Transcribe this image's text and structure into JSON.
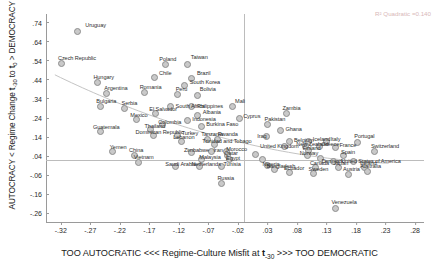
{
  "chart_data": {
    "type": "scatter",
    "title": "",
    "xlabel": "TOO AUTOCRATIC <<< Regime-Culture Misfit at t-30 >>> TOO DEMOCRATIC",
    "ylabel": "AUTOCRACY < Regime Change t-30 to t0 > DEMOCRACY",
    "xlim": [
      -0.345,
      0.295
    ],
    "ylim": [
      -0.305,
      0.785
    ],
    "xticks": [
      "-.32",
      "-.27",
      "-.22",
      "-.17",
      "-.12",
      "-.07",
      "-.02",
      ".03",
      ".08",
      ".13",
      ".18",
      ".23",
      ".28"
    ],
    "xtick_values": [
      -0.32,
      -0.27,
      -0.22,
      -0.17,
      -0.12,
      -0.07,
      -0.02,
      0.03,
      0.08,
      0.13,
      0.18,
      0.23,
      0.28
    ],
    "yticks": [
      ".74",
      ".64",
      ".54",
      ".44",
      ".34",
      ".24",
      ".14",
      ".04",
      "-.06",
      "-.16",
      "-.26"
    ],
    "ytick_values": [
      0.74,
      0.64,
      0.54,
      0.44,
      0.34,
      0.24,
      0.14,
      0.04,
      -0.06,
      -0.16,
      -0.26
    ],
    "grid": false,
    "legend": "none",
    "annotation": "R² Quadratic =0.140",
    "reference_lines": {
      "vertical_x": -0.01,
      "horizontal_y": 0.02
    },
    "fit": "quadratic",
    "points": [
      {
        "label": "Uruguay",
        "x": -0.292,
        "y": 0.695
      },
      {
        "label": "Czech Republic",
        "x": -0.318,
        "y": 0.525
      },
      {
        "label": "Poland",
        "x": -0.143,
        "y": 0.518
      },
      {
        "label": "Taiwan",
        "x": -0.105,
        "y": 0.52
      },
      {
        "label": "Hungary",
        "x": -0.258,
        "y": 0.425
      },
      {
        "label": "Chile",
        "x": -0.162,
        "y": 0.452
      },
      {
        "label": "Brazil",
        "x": -0.098,
        "y": 0.447
      },
      {
        "label": "South Korea",
        "x": -0.11,
        "y": 0.41
      },
      {
        "label": "Argentina",
        "x": -0.243,
        "y": 0.368
      },
      {
        "label": "Romania",
        "x": -0.178,
        "y": 0.372
      },
      {
        "label": "Peru",
        "x": -0.122,
        "y": 0.362
      },
      {
        "label": "Bolivia",
        "x": -0.088,
        "y": 0.358
      },
      {
        "label": "Bulgaria",
        "x": -0.253,
        "y": 0.3
      },
      {
        "label": "Serbia",
        "x": -0.212,
        "y": 0.288
      },
      {
        "label": "South Africa",
        "x": -0.134,
        "y": 0.3
      },
      {
        "label": "Philippines",
        "x": -0.098,
        "y": 0.3
      },
      {
        "label": "Mali",
        "x": -0.03,
        "y": 0.3
      },
      {
        "label": "El Salvador",
        "x": -0.16,
        "y": 0.262
      },
      {
        "label": "Albania",
        "x": -0.088,
        "y": 0.255
      },
      {
        "label": "Cyprus",
        "x": -0.018,
        "y": 0.238
      },
      {
        "label": "Mexico",
        "x": -0.192,
        "y": 0.232
      },
      {
        "label": "Indonesia",
        "x": -0.106,
        "y": 0.225
      },
      {
        "label": "Zambia",
        "x": 0.062,
        "y": 0.262
      },
      {
        "label": "Colombia",
        "x": -0.148,
        "y": 0.205
      },
      {
        "label": "Burkina Faso",
        "x": -0.082,
        "y": 0.198
      },
      {
        "label": "Pakistan",
        "x": 0.03,
        "y": 0.205
      },
      {
        "label": "Thailand",
        "x": -0.168,
        "y": 0.178
      },
      {
        "label": "Guatemala",
        "x": -0.252,
        "y": 0.168
      },
      {
        "label": "Ghana",
        "x": 0.052,
        "y": 0.172
      },
      {
        "label": "Dominican Republic",
        "x": -0.163,
        "y": 0.148
      },
      {
        "label": "Turkey",
        "x": -0.122,
        "y": 0.15
      },
      {
        "label": "Iraq",
        "x": 0.028,
        "y": 0.142
      },
      {
        "label": "Lebanon",
        "x": -0.116,
        "y": 0.118
      },
      {
        "label": "Tanzania",
        "x": -0.072,
        "y": 0.128
      },
      {
        "label": "Rwanda",
        "x": -0.054,
        "y": 0.128
      },
      {
        "label": "Belgium",
        "x": 0.068,
        "y": 0.118
      },
      {
        "label": "Iceland",
        "x": 0.1,
        "y": 0.118
      },
      {
        "label": "Italy",
        "x": 0.13,
        "y": 0.118
      },
      {
        "label": "Portugal",
        "x": 0.182,
        "y": 0.112
      },
      {
        "label": "Trinidad and Tobago",
        "x": -0.06,
        "y": 0.102
      },
      {
        "label": "Yemen",
        "x": -0.232,
        "y": 0.062
      },
      {
        "label": "United Kingdom",
        "x": 0.058,
        "y": 0.09
      },
      {
        "label": "New Zealand",
        "x": 0.094,
        "y": 0.09
      },
      {
        "label": "Greece",
        "x": 0.118,
        "y": 0.09
      },
      {
        "label": "France",
        "x": 0.145,
        "y": 0.088
      },
      {
        "label": "China",
        "x": -0.196,
        "y": 0.045
      },
      {
        "label": "Zimbabwe",
        "x": -0.098,
        "y": 0.06
      },
      {
        "label": "Iran",
        "x": -0.065,
        "y": 0.062
      },
      {
        "label": "Morocco",
        "x": -0.04,
        "y": 0.062
      },
      {
        "label": "Finland",
        "x": 0.1,
        "y": 0.068
      },
      {
        "label": "Switzerland",
        "x": 0.212,
        "y": 0.065
      },
      {
        "label": "Norway",
        "x": 0.098,
        "y": 0.045
      },
      {
        "label": "Qatar",
        "x": -0.038,
        "y": 0.042
      },
      {
        "label": "Qatar2",
        "x": 0.01,
        "y": 0.048
      },
      {
        "label": "Spain",
        "x": 0.158,
        "y": 0.045
      },
      {
        "label": "Vietnam",
        "x": -0.188,
        "y": 0.008
      },
      {
        "label": "Malaysia",
        "x": -0.082,
        "y": 0.022
      },
      {
        "label": "Egypt",
        "x": -0.035,
        "y": 0.022
      },
      {
        "label": "Brazil2",
        "x": 0.022,
        "y": 0.022
      },
      {
        "label": "Polaris",
        "x": 0.12,
        "y": 0.028
      },
      {
        "label": "Denmark",
        "x": 0.142,
        "y": 0.012
      },
      {
        "label": "United States of America",
        "x": 0.175,
        "y": 0.012
      },
      {
        "label": "Saudi Arabia",
        "x": -0.126,
        "y": -0.012
      },
      {
        "label": "Netherlands",
        "x": -0.085,
        "y": -0.012
      },
      {
        "label": "Tunisia",
        "x": -0.048,
        "y": -0.012
      },
      {
        "label": "Nigeria",
        "x": 0.03,
        "y": -0.008
      },
      {
        "label": "Canada",
        "x": 0.112,
        "y": -0.018
      },
      {
        "label": "Japan",
        "x": 0.15,
        "y": -0.022
      },
      {
        "label": "Ireland",
        "x": 0.195,
        "y": -0.018
      },
      {
        "label": "Bangladesh",
        "x": 0.042,
        "y": -0.032
      },
      {
        "label": "Australia",
        "x": 0.2,
        "y": -0.038
      },
      {
        "label": "Ecuador",
        "x": 0.068,
        "y": -0.048
      },
      {
        "label": "Sweden",
        "x": 0.108,
        "y": -0.052
      },
      {
        "label": "Austria",
        "x": 0.168,
        "y": -0.058
      },
      {
        "label": "Russia",
        "x": -0.048,
        "y": -0.105
      },
      {
        "label": "Venezuela",
        "x": 0.145,
        "y": -0.232
      }
    ],
    "labelled_points": [
      {
        "label": "Uruguay",
        "x": -0.292,
        "y": 0.695,
        "dx": 8,
        "dy": -9
      },
      {
        "label": "Czech Republic",
        "x": -0.318,
        "y": 0.525,
        "dx": -4,
        "dy": -9
      },
      {
        "label": "Poland",
        "x": -0.143,
        "y": 0.518,
        "dx": -6,
        "dy": -9
      },
      {
        "label": "Taiwan",
        "x": -0.105,
        "y": 0.52,
        "dx": 3,
        "dy": -11
      },
      {
        "label": "Hungary",
        "x": -0.258,
        "y": 0.425,
        "dx": -4,
        "dy": -9
      },
      {
        "label": "Chile",
        "x": -0.162,
        "y": 0.452,
        "dx": 5,
        "dy": -8
      },
      {
        "label": "Brazil",
        "x": -0.098,
        "y": 0.447,
        "dx": 5,
        "dy": -8
      },
      {
        "label": "South Korea",
        "x": -0.11,
        "y": 0.41,
        "dx": 5,
        "dy": -7
      },
      {
        "label": "Argentina",
        "x": -0.243,
        "y": 0.368,
        "dx": -2,
        "dy": -9
      },
      {
        "label": "Romania",
        "x": -0.178,
        "y": 0.372,
        "dx": -5,
        "dy": -9
      },
      {
        "label": "Peru",
        "x": -0.122,
        "y": 0.362,
        "dx": -2,
        "dy": -9
      },
      {
        "label": "Bolivia",
        "x": -0.088,
        "y": 0.358,
        "dx": 2,
        "dy": -9
      },
      {
        "label": "Bulgaria",
        "x": -0.253,
        "y": 0.3,
        "dx": -4,
        "dy": -9
      },
      {
        "label": "Serbia",
        "x": -0.212,
        "y": 0.288,
        "dx": -3,
        "dy": -9
      },
      {
        "label": "South Africa",
        "x": -0.134,
        "y": 0.3,
        "dx": 5,
        "dy": -4
      },
      {
        "label": "Philippines",
        "x": -0.098,
        "y": 0.3,
        "dx": 5,
        "dy": -4
      },
      {
        "label": "Mali",
        "x": -0.03,
        "y": 0.3,
        "dx": 3,
        "dy": -9
      },
      {
        "label": "El Salvador",
        "x": -0.16,
        "y": 0.262,
        "dx": -6,
        "dy": -8
      },
      {
        "label": "Albania",
        "x": -0.088,
        "y": 0.255,
        "dx": 5,
        "dy": -6
      },
      {
        "label": "Cyprus",
        "x": -0.018,
        "y": 0.238,
        "dx": 4,
        "dy": -5
      },
      {
        "label": "Mexico",
        "x": -0.192,
        "y": 0.232,
        "dx": -6,
        "dy": -8
      },
      {
        "label": "Indonesia",
        "x": -0.106,
        "y": 0.225,
        "dx": 5,
        "dy": -5
      },
      {
        "label": "Zambia",
        "x": 0.062,
        "y": 0.262,
        "dx": -4,
        "dy": -9
      },
      {
        "label": "Colombia",
        "x": -0.148,
        "y": 0.205,
        "dx": -4,
        "dy": -6
      },
      {
        "label": "Burkina Faso",
        "x": -0.082,
        "y": 0.198,
        "dx": 5,
        "dy": -5
      },
      {
        "label": "Pakistan",
        "x": 0.03,
        "y": 0.205,
        "dx": -3,
        "dy": -9
      },
      {
        "label": "Thailand",
        "x": -0.168,
        "y": 0.178,
        "dx": -6,
        "dy": -7
      },
      {
        "label": "Guatemala",
        "x": -0.252,
        "y": 0.168,
        "dx": -8,
        "dy": -8
      },
      {
        "label": "Ghana",
        "x": 0.052,
        "y": 0.172,
        "dx": 5,
        "dy": -5
      },
      {
        "label": "Dominican Republic",
        "x": -0.163,
        "y": 0.148,
        "dx": -18,
        "dy": -7
      },
      {
        "label": "Turkey",
        "x": -0.122,
        "y": 0.15,
        "dx": 4,
        "dy": -5
      },
      {
        "label": "Iraq",
        "x": 0.028,
        "y": 0.142,
        "dx": -9,
        "dy": -4
      },
      {
        "label": "Lebanon",
        "x": -0.116,
        "y": 0.118,
        "dx": -8,
        "dy": -7
      },
      {
        "label": "Tanzania",
        "x": -0.072,
        "y": 0.128,
        "dx": -6,
        "dy": -8
      },
      {
        "label": "Rwanda",
        "x": -0.054,
        "y": 0.128,
        "dx": 0,
        "dy": -8
      },
      {
        "label": "Belgium",
        "x": 0.068,
        "y": 0.118,
        "dx": 4,
        "dy": -4
      },
      {
        "label": "Iceland",
        "x": 0.1,
        "y": 0.118,
        "dx": 4,
        "dy": -5
      },
      {
        "label": "Italy",
        "x": 0.13,
        "y": 0.118,
        "dx": 4,
        "dy": -5
      },
      {
        "label": "Portugal",
        "x": 0.182,
        "y": 0.112,
        "dx": -3,
        "dy": -9
      },
      {
        "label": "Trinidad and Tobago",
        "x": -0.06,
        "y": 0.102,
        "dx": -12,
        "dy": -6
      },
      {
        "label": "Yemen",
        "x": -0.232,
        "y": 0.062,
        "dx": -3,
        "dy": -8
      },
      {
        "label": "United Kingdom",
        "x": 0.058,
        "y": 0.09,
        "dx": -24,
        "dy": -4
      },
      {
        "label": "New Zealand",
        "x": 0.094,
        "y": 0.09,
        "dx": -9,
        "dy": -6
      },
      {
        "label": "Greece",
        "x": 0.118,
        "y": 0.09,
        "dx": 2,
        "dy": -6
      },
      {
        "label": "France",
        "x": 0.145,
        "y": 0.088,
        "dx": 4,
        "dy": -5
      },
      {
        "label": "China",
        "x": -0.196,
        "y": 0.045,
        "dx": -5,
        "dy": -8
      },
      {
        "label": "Zimbabwe",
        "x": -0.098,
        "y": 0.06,
        "dx": -8,
        "dy": -5
      },
      {
        "label": "Iran",
        "x": -0.065,
        "y": 0.062,
        "dx": 2,
        "dy": -5
      },
      {
        "label": "Morocco",
        "x": -0.04,
        "y": 0.062,
        "dx": 0,
        "dy": -6
      },
      {
        "label": "Finland",
        "x": 0.1,
        "y": 0.068,
        "dx": -6,
        "dy": -6
      },
      {
        "label": "Switzerland",
        "x": 0.212,
        "y": 0.065,
        "dx": -4,
        "dy": -8
      },
      {
        "label": "Norway",
        "x": 0.098,
        "y": 0.045,
        "dx": -8,
        "dy": -5
      },
      {
        "label": "Qatar",
        "x": -0.038,
        "y": 0.042,
        "dx": -3,
        "dy": -6
      },
      {
        "label": "Spain",
        "x": 0.158,
        "y": 0.045,
        "dx": -2,
        "dy": -6
      },
      {
        "label": "Vietnam",
        "x": -0.188,
        "y": 0.008,
        "dx": -5,
        "dy": -8
      },
      {
        "label": "Malaysia",
        "x": -0.082,
        "y": 0.022,
        "dx": -2,
        "dy": -6
      },
      {
        "label": "Egypt",
        "x": -0.035,
        "y": 0.022,
        "dx": -3,
        "dy": -5
      },
      {
        "label": "Denmark",
        "x": 0.142,
        "y": 0.012,
        "dx": -12,
        "dy": -4
      },
      {
        "label": "United States of America",
        "x": 0.175,
        "y": 0.012,
        "dx": -12,
        "dy": -4
      },
      {
        "label": "Saudi Arabia",
        "x": -0.126,
        "y": -0.012,
        "dx": -10,
        "dy": -5
      },
      {
        "label": "Netherlands",
        "x": -0.085,
        "y": -0.012,
        "dx": -8,
        "dy": -5
      },
      {
        "label": "Tunisia",
        "x": -0.048,
        "y": -0.012,
        "dx": 2,
        "dy": -5
      },
      {
        "label": "Nigeria",
        "x": 0.03,
        "y": -0.008,
        "dx": -5,
        "dy": -4
      },
      {
        "label": "Canada",
        "x": 0.112,
        "y": -0.018,
        "dx": -6,
        "dy": -7
      },
      {
        "label": "Japan",
        "x": 0.15,
        "y": -0.022,
        "dx": -5,
        "dy": -8
      },
      {
        "label": "Ireland",
        "x": 0.195,
        "y": -0.018,
        "dx": -5,
        "dy": -7
      },
      {
        "label": "Bangladesh",
        "x": 0.042,
        "y": -0.032,
        "dx": -8,
        "dy": -7
      },
      {
        "label": "Australia",
        "x": 0.2,
        "y": -0.038,
        "dx": -8,
        "dy": -8
      },
      {
        "label": "Ecuador",
        "x": 0.068,
        "y": -0.048,
        "dx": -6,
        "dy": -8
      },
      {
        "label": "Sweden",
        "x": 0.108,
        "y": -0.052,
        "dx": -5,
        "dy": -8
      },
      {
        "label": "Austria",
        "x": 0.168,
        "y": -0.058,
        "dx": -6,
        "dy": -9
      },
      {
        "label": "Russia",
        "x": -0.048,
        "y": -0.105,
        "dx": -4,
        "dy": -9
      },
      {
        "label": "Venezuela",
        "x": 0.145,
        "y": -0.232,
        "dx": -4,
        "dy": -9
      }
    ]
  }
}
